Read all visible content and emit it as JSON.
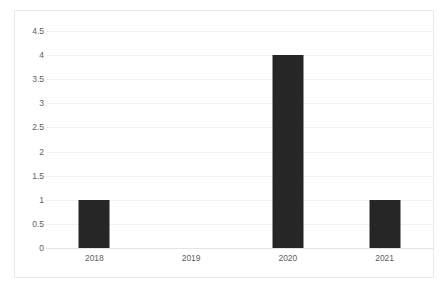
{
  "chart_data": {
    "type": "bar",
    "title": "",
    "subtitle": "",
    "xlabel": "",
    "ylabel": "",
    "categories": [
      "2018",
      "2019",
      "2020",
      "2021"
    ],
    "values": [
      1,
      0,
      4,
      1
    ],
    "series": [
      {
        "name": "",
        "values": [
          1,
          0,
          4,
          1
        ]
      }
    ],
    "ylim": [
      0,
      4.5
    ],
    "ytick_labels": [
      "0",
      "0.5",
      "1",
      "1.5",
      "2",
      "2.5",
      "3",
      "3.5",
      "4",
      "4.5"
    ],
    "ytick_values": [
      0,
      0.5,
      1,
      1.5,
      2,
      2.5,
      3,
      3.5,
      4,
      4.5
    ],
    "grid": true,
    "grid_axis": "y",
    "legend": false,
    "legend_position": "none",
    "annotations": [],
    "colors": {
      "bar": "#262626",
      "gridline": "#f2f2f2",
      "baseline": "#e4e4e4",
      "frame_border": "#e9e9e9",
      "tick_label": "#5e5e5e",
      "plot_background": "#ffffff"
    }
  }
}
